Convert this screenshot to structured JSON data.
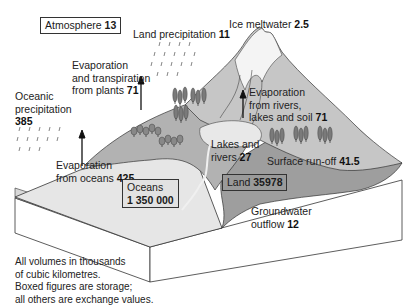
{
  "colors": {
    "ocean_surface": "#e4e4e4",
    "land_lowland": "#b4b4b4",
    "land_dark": "#9a9a9a",
    "mountain": "#c8c8c8",
    "lake": "#e8e8e8",
    "outline": "#333333"
  },
  "storage": {
    "atmosphere": {
      "label": "Atmosphere",
      "value": "13"
    },
    "oceans": {
      "label": "Oceans",
      "value": "1 350 000"
    },
    "land": {
      "label": "Land",
      "value": "35978"
    }
  },
  "exchange": {
    "land_precipitation": {
      "label": "Land precipitation",
      "value": "11"
    },
    "ice_meltwater": {
      "label": "Ice meltwater",
      "value": "2.5"
    },
    "evap_plants": {
      "line1": "Evaporation",
      "line2": "and transpiration",
      "line3": "from plants",
      "value": "71"
    },
    "oceanic_precipitation": {
      "line1": "Oceanic",
      "line2": "precipitation",
      "value": "385"
    },
    "evap_rivers": {
      "line1": "Evaporation",
      "line2": "from rivers,",
      "line3": "lakes and soil",
      "value": "71"
    },
    "lakes_rivers": {
      "line1": "Lakes and",
      "line2": "rivers",
      "value": "27"
    },
    "surface_runoff": {
      "label": "Surface run-off",
      "value": "41.5"
    },
    "evap_oceans": {
      "line1": "Evaporation",
      "line2": "from oceans",
      "value": "425"
    },
    "groundwater": {
      "line1": "Groundwater",
      "line2": "outflow",
      "value": "12"
    }
  },
  "notes": {
    "line1": "All volumes in thousands",
    "line2": "of cubic kilometres.",
    "line3": "Boxed figures are storage;",
    "line4": "all others are exchange values."
  },
  "icons": [
    "rain-icon",
    "arrow-up-icon",
    "tree-icon",
    "mountain-icon"
  ]
}
